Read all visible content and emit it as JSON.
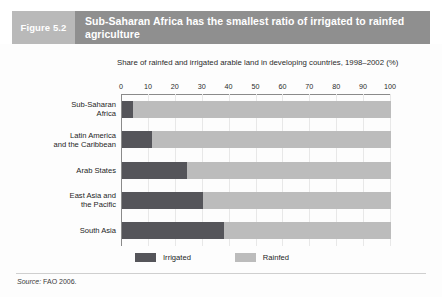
{
  "header": {
    "figure_number": "Figure 5.2",
    "title": "Sub-Saharan Africa has the smallest ratio of irrigated to rainfed agriculture",
    "figure_block_color": "#b9b9b9",
    "title_block_color": "#8f8f8f"
  },
  "source": {
    "label": "Source:",
    "text": "FAO 2006."
  },
  "chart_data": {
    "type": "bar",
    "orientation": "horizontal",
    "stacked": true,
    "title": "Share of rainfed and irrigated arable land in developing countries, 1998–2002 (%)",
    "xlabel": "",
    "ylabel": "",
    "xlim": [
      0,
      100
    ],
    "grid": true,
    "legend_position": "bottom",
    "xticks": [
      0,
      10,
      20,
      30,
      40,
      50,
      60,
      70,
      80,
      90,
      100
    ],
    "xtick_labels": [
      "0",
      "10",
      "20",
      "30",
      "40",
      "50",
      "60",
      "70",
      "80",
      "90",
      "100"
    ],
    "categories": [
      "Sub-Saharan Africa",
      "Latin America and the Caribbean",
      "Arab States",
      "East Asia and the Pacific",
      "South Asia"
    ],
    "category_lines": [
      [
        "Sub-Saharan",
        "Africa"
      ],
      [
        "Latin America",
        "and  the Caribbean"
      ],
      [
        "Arab States"
      ],
      [
        "East Asia and",
        "the Pacific"
      ],
      [
        "South Asia"
      ]
    ],
    "series": [
      {
        "name": "Irrigated",
        "color": "#55555a",
        "values": [
          4,
          11,
          24,
          30,
          38
        ]
      },
      {
        "name": "Rainfed",
        "color": "#bcbcbc",
        "values": [
          96,
          89,
          76,
          70,
          62
        ]
      }
    ]
  }
}
